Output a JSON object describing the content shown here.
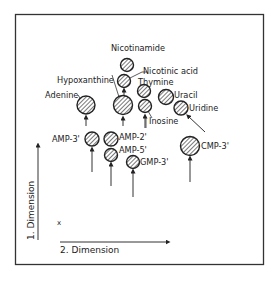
{
  "figure": {
    "type": "2D chromatogram spot map",
    "axes": {
      "y_label": "1. Dimension",
      "x_label": "2. Dimension",
      "origin_marker": "x"
    },
    "colors": {
      "line": "#333333",
      "spot_fill": "#ffffff",
      "hatch": "#555555"
    },
    "spots": [
      {
        "id": "nicotinamide",
        "label": "Nicotinamide",
        "cx": 127,
        "cy": 65,
        "r": 6.5
      },
      {
        "id": "nicotinic-acid",
        "label": "Nicotinic acid",
        "cx": 124,
        "cy": 81,
        "r": 6.5
      },
      {
        "id": "hypoxanthine",
        "label": "Hypoxanthine",
        "cx": 123,
        "cy": 105,
        "r": 9.5
      },
      {
        "id": "adenine",
        "label": "Adenine",
        "cx": 86,
        "cy": 105,
        "r": 9
      },
      {
        "id": "thymine",
        "label": "Thymine",
        "cx": 144,
        "cy": 91,
        "r": 6.5
      },
      {
        "id": "inosine",
        "label": "Inosine",
        "cx": 145,
        "cy": 106,
        "r": 6.5
      },
      {
        "id": "uracil",
        "label": "Uracil",
        "cx": 166,
        "cy": 97,
        "r": 7.5
      },
      {
        "id": "uridine",
        "label": "Uridine",
        "cx": 181,
        "cy": 108,
        "r": 7
      },
      {
        "id": "amp-3",
        "label": "AMP-3'",
        "cx": 92,
        "cy": 139,
        "r": 7
      },
      {
        "id": "amp-2",
        "label": "AMP-2'",
        "cx": 111,
        "cy": 139,
        "r": 7
      },
      {
        "id": "amp-5",
        "label": "AMP-5'",
        "cx": 111,
        "cy": 155,
        "r": 6.5
      },
      {
        "id": "gmp-3",
        "label": "GMP-3'",
        "cx": 133,
        "cy": 162,
        "r": 6.5
      },
      {
        "id": "cmp-3",
        "label": "CMP-3'",
        "cx": 190,
        "cy": 146,
        "r": 9.5
      }
    ]
  }
}
